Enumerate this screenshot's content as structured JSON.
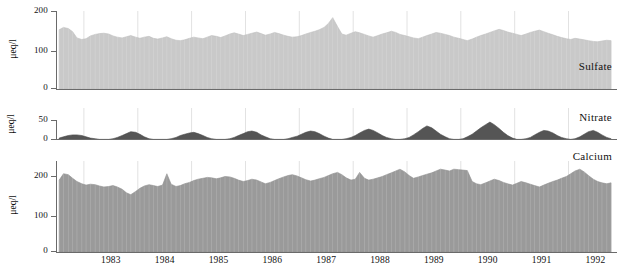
{
  "figure": {
    "background": "#ffffff",
    "x_axis_label": "",
    "x_tick_labels": [
      "1983",
      "1984",
      "1985",
      "1986",
      "1987",
      "1988",
      "1989",
      "1990",
      "1991",
      "1992"
    ],
    "x_range_start": 1982.5,
    "x_range_end": 1992.9
  },
  "panels": [
    {
      "name": "sulfate",
      "series_label": "Sulfate",
      "y_axis_label": "μeq/l",
      "y_ticks": [
        0,
        100,
        200
      ],
      "ylim": [
        0,
        200
      ],
      "fill_color": "#c9c9c9",
      "line_color": "#bdbdbd"
    },
    {
      "name": "nitrate",
      "series_label": "Nitrate",
      "y_axis_label": "μeq/l",
      "y_ticks": [
        0,
        50
      ],
      "ylim": [
        0,
        50
      ],
      "fill_color": "#555555",
      "line_color": "#4a4a4a"
    },
    {
      "name": "calcium",
      "series_label": "Calcium",
      "y_axis_label": "μeq/l",
      "y_ticks": [
        0,
        100,
        200
      ],
      "ylim": [
        0,
        200
      ],
      "fill_color": "#9a9a9a",
      "line_color": "#8f8f8f"
    }
  ],
  "chart_data": [
    {
      "type": "area",
      "title": "Sulfate",
      "xlabel": "",
      "ylabel": "μeq/l",
      "ylim": [
        0,
        200
      ],
      "xlim": [
        1982.5,
        1992.9
      ],
      "grid": true,
      "legend": "inline-right",
      "x": [
        1982.54,
        1982.62,
        1982.71,
        1982.79,
        1982.87,
        1982.96,
        1983.04,
        1983.12,
        1983.21,
        1983.29,
        1983.37,
        1983.46,
        1983.54,
        1983.62,
        1983.71,
        1983.79,
        1983.87,
        1983.96,
        1984.04,
        1984.12,
        1984.21,
        1984.29,
        1984.37,
        1984.46,
        1984.54,
        1984.62,
        1984.71,
        1984.79,
        1984.87,
        1984.96,
        1985.04,
        1985.12,
        1985.21,
        1985.29,
        1985.37,
        1985.46,
        1985.54,
        1985.62,
        1985.71,
        1985.79,
        1985.87,
        1985.96,
        1986.04,
        1986.12,
        1986.21,
        1986.29,
        1986.37,
        1986.46,
        1986.54,
        1986.62,
        1986.71,
        1986.79,
        1986.87,
        1986.96,
        1987.04,
        1987.12,
        1987.21,
        1987.29,
        1987.37,
        1987.46,
        1987.54,
        1987.62,
        1987.71,
        1987.79,
        1987.87,
        1987.96,
        1988.04,
        1988.12,
        1988.21,
        1988.29,
        1988.37,
        1988.46,
        1988.54,
        1988.62,
        1988.71,
        1988.79,
        1988.87,
        1988.96,
        1989.04,
        1989.12,
        1989.21,
        1989.29,
        1989.37,
        1989.46,
        1989.54,
        1989.62,
        1989.71,
        1989.79,
        1989.87,
        1989.96,
        1990.04,
        1990.12,
        1990.21,
        1990.29,
        1990.37,
        1990.46,
        1990.54,
        1990.62,
        1990.71,
        1990.79,
        1990.87,
        1990.96,
        1991.04,
        1991.12,
        1991.21,
        1991.29,
        1991.37,
        1991.46,
        1991.54,
        1991.62,
        1991.71,
        1991.79,
        1991.87,
        1991.96,
        1992.04,
        1992.12,
        1992.21,
        1992.29,
        1992.37,
        1992.46,
        1992.54,
        1992.62,
        1992.71,
        1992.79
      ],
      "values": [
        152,
        158,
        155,
        147,
        131,
        127,
        129,
        136,
        140,
        142,
        143,
        141,
        136,
        133,
        131,
        134,
        137,
        133,
        130,
        133,
        135,
        130,
        128,
        131,
        134,
        129,
        125,
        124,
        126,
        130,
        133,
        131,
        129,
        133,
        137,
        135,
        132,
        136,
        141,
        144,
        141,
        137,
        140,
        143,
        146,
        142,
        138,
        141,
        145,
        142,
        138,
        135,
        133,
        134,
        137,
        141,
        145,
        148,
        152,
        158,
        168,
        183,
        160,
        141,
        138,
        143,
        147,
        144,
        140,
        136,
        133,
        137,
        141,
        144,
        148,
        145,
        140,
        137,
        134,
        131,
        129,
        133,
        137,
        141,
        145,
        143,
        140,
        137,
        133,
        130,
        127,
        124,
        128,
        133,
        137,
        141,
        145,
        149,
        153,
        150,
        146,
        143,
        140,
        137,
        141,
        145,
        148,
        151,
        147,
        143,
        139,
        135,
        132,
        129,
        127,
        130,
        128,
        126,
        124,
        122,
        121,
        123,
        125,
        124
      ]
    },
    {
      "type": "area",
      "title": "Nitrate",
      "xlabel": "",
      "ylabel": "μeq/l",
      "ylim": [
        0,
        50
      ],
      "xlim": [
        1982.5,
        1992.9
      ],
      "grid": true,
      "legend": "inline-right",
      "x": [
        1982.54,
        1982.62,
        1982.71,
        1982.79,
        1982.87,
        1982.96,
        1983.04,
        1983.12,
        1983.21,
        1983.29,
        1983.37,
        1983.46,
        1983.54,
        1983.62,
        1983.71,
        1983.79,
        1983.87,
        1983.96,
        1984.04,
        1984.12,
        1984.21,
        1984.29,
        1984.37,
        1984.46,
        1984.54,
        1984.62,
        1984.71,
        1984.79,
        1984.87,
        1984.96,
        1985.04,
        1985.12,
        1985.21,
        1985.29,
        1985.37,
        1985.46,
        1985.54,
        1985.62,
        1985.71,
        1985.79,
        1985.87,
        1985.96,
        1986.04,
        1986.12,
        1986.21,
        1986.29,
        1986.37,
        1986.46,
        1986.54,
        1986.62,
        1986.71,
        1986.79,
        1986.87,
        1986.96,
        1987.04,
        1987.12,
        1987.21,
        1987.29,
        1987.37,
        1987.46,
        1987.54,
        1987.62,
        1987.71,
        1987.79,
        1987.87,
        1987.96,
        1988.04,
        1988.12,
        1988.21,
        1988.29,
        1988.37,
        1988.46,
        1988.54,
        1988.62,
        1988.71,
        1988.79,
        1988.87,
        1988.96,
        1989.04,
        1989.12,
        1989.21,
        1989.29,
        1989.37,
        1989.46,
        1989.54,
        1989.62,
        1989.71,
        1989.79,
        1989.87,
        1989.96,
        1990.04,
        1990.12,
        1990.21,
        1990.29,
        1990.37,
        1990.46,
        1990.54,
        1990.62,
        1990.71,
        1990.79,
        1990.87,
        1990.96,
        1991.04,
        1991.12,
        1991.21,
        1991.29,
        1991.37,
        1991.46,
        1991.54,
        1991.62,
        1991.71,
        1991.79,
        1991.87,
        1991.96,
        1992.04,
        1992.12,
        1992.21,
        1992.29,
        1992.37,
        1992.46,
        1992.54,
        1992.62,
        1992.71,
        1992.79
      ],
      "values": [
        3,
        5,
        7,
        8,
        8,
        7,
        5,
        3,
        2,
        1,
        1,
        1,
        2,
        4,
        7,
        10,
        13,
        12,
        9,
        5,
        2,
        1,
        1,
        1,
        1,
        2,
        4,
        7,
        9,
        11,
        12,
        10,
        7,
        4,
        2,
        1,
        1,
        1,
        2,
        4,
        7,
        10,
        13,
        14,
        12,
        8,
        5,
        2,
        1,
        1,
        1,
        2,
        4,
        6,
        9,
        12,
        14,
        13,
        10,
        6,
        3,
        1,
        1,
        1,
        2,
        4,
        7,
        11,
        15,
        17,
        15,
        11,
        7,
        4,
        2,
        1,
        1,
        2,
        4,
        8,
        13,
        18,
        22,
        19,
        14,
        9,
        5,
        2,
        1,
        1,
        2,
        5,
        9,
        14,
        19,
        24,
        28,
        24,
        18,
        12,
        7,
        3,
        1,
        1,
        2,
        4,
        8,
        12,
        15,
        14,
        11,
        7,
        4,
        2,
        1,
        2,
        5,
        9,
        13,
        15,
        12,
        8,
        4,
        2
      ]
    },
    {
      "type": "area",
      "title": "Calcium",
      "xlabel": "",
      "ylabel": "μeq/l",
      "ylim": [
        0,
        200
      ],
      "xlim": [
        1982.5,
        1992.9
      ],
      "grid": true,
      "legend": "inline-right",
      "x": [
        1982.54,
        1982.62,
        1982.71,
        1982.79,
        1982.87,
        1982.96,
        1983.04,
        1983.12,
        1983.21,
        1983.29,
        1983.37,
        1983.46,
        1983.54,
        1983.62,
        1983.71,
        1983.79,
        1983.87,
        1983.96,
        1984.04,
        1984.12,
        1984.21,
        1984.29,
        1984.37,
        1984.46,
        1984.54,
        1984.62,
        1984.71,
        1984.79,
        1984.87,
        1984.96,
        1985.04,
        1985.12,
        1985.21,
        1985.29,
        1985.37,
        1985.46,
        1985.54,
        1985.62,
        1985.71,
        1985.79,
        1985.87,
        1985.96,
        1986.04,
        1986.12,
        1986.21,
        1986.29,
        1986.37,
        1986.46,
        1986.54,
        1986.62,
        1986.71,
        1986.79,
        1986.87,
        1986.96,
        1987.04,
        1987.12,
        1987.21,
        1987.29,
        1987.37,
        1987.46,
        1987.54,
        1987.62,
        1987.71,
        1987.79,
        1987.87,
        1987.96,
        1988.04,
        1988.12,
        1988.21,
        1988.29,
        1988.37,
        1988.46,
        1988.54,
        1988.62,
        1988.71,
        1988.79,
        1988.87,
        1988.96,
        1989.04,
        1989.12,
        1989.21,
        1989.29,
        1989.37,
        1989.46,
        1989.54,
        1989.62,
        1989.71,
        1989.79,
        1989.87,
        1989.96,
        1990.04,
        1990.12,
        1990.21,
        1990.29,
        1990.37,
        1990.46,
        1990.54,
        1990.62,
        1990.71,
        1990.79,
        1990.87,
        1990.96,
        1991.04,
        1991.12,
        1991.21,
        1991.29,
        1991.37,
        1991.46,
        1991.54,
        1991.62,
        1991.71,
        1991.79,
        1991.87,
        1991.96,
        1992.04,
        1992.12,
        1992.21,
        1992.29,
        1992.37,
        1992.46,
        1992.54,
        1992.62,
        1992.71,
        1992.79
      ],
      "values": [
        158,
        172,
        170,
        162,
        155,
        150,
        147,
        149,
        148,
        145,
        143,
        144,
        146,
        143,
        138,
        130,
        126,
        133,
        140,
        145,
        148,
        146,
        144,
        147,
        172,
        149,
        144,
        146,
        150,
        153,
        157,
        160,
        162,
        164,
        163,
        161,
        163,
        166,
        165,
        162,
        158,
        155,
        157,
        160,
        158,
        154,
        150,
        153,
        157,
        161,
        165,
        168,
        170,
        167,
        163,
        159,
        156,
        158,
        161,
        164,
        168,
        172,
        175,
        170,
        163,
        158,
        160,
        175,
        162,
        158,
        160,
        163,
        166,
        170,
        174,
        178,
        182,
        176,
        168,
        162,
        165,
        168,
        171,
        174,
        178,
        182,
        180,
        178,
        182,
        181,
        180,
        179,
        155,
        150,
        148,
        152,
        156,
        160,
        157,
        153,
        150,
        147,
        151,
        155,
        152,
        149,
        146,
        143,
        147,
        151,
        155,
        158,
        162,
        166,
        172,
        178,
        182,
        176,
        168,
        160,
        155,
        152,
        150,
        152
      ]
    }
  ]
}
